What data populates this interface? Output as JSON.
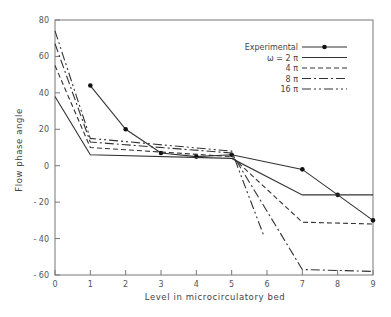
{
  "chart_data": {
    "type": "line",
    "title": "",
    "xlabel": "Level in microcirculatory bed",
    "ylabel": "Flow phase angle",
    "xlim": [
      0,
      9
    ],
    "ylim": [
      -60,
      80
    ],
    "x_ticks": [
      0,
      1,
      2,
      3,
      4,
      5,
      6,
      7,
      8,
      9
    ],
    "y_ticks": [
      -60,
      -40,
      -20,
      0,
      20,
      40,
      60,
      80
    ],
    "grid": false,
    "legend_position": "upper right",
    "series": [
      {
        "name": "Experimental",
        "style": "solid-with-markers",
        "points": [
          [
            1,
            44
          ],
          [
            2,
            20
          ],
          [
            3,
            7
          ],
          [
            4,
            5
          ],
          [
            5,
            6
          ],
          [
            7,
            -2
          ],
          [
            8,
            -16
          ],
          [
            9,
            -30
          ]
        ]
      },
      {
        "name": "ω = 2 π",
        "style": "solid",
        "points": [
          [
            0,
            38
          ],
          [
            1,
            6
          ],
          [
            5,
            4
          ],
          [
            7,
            -16
          ],
          [
            9,
            -16
          ]
        ]
      },
      {
        "name": "4 π",
        "style": "dashed",
        "points": [
          [
            0,
            55
          ],
          [
            1,
            10
          ],
          [
            5,
            5
          ],
          [
            7,
            -31
          ],
          [
            9,
            -32
          ]
        ]
      },
      {
        "name": "8 π",
        "style": "dash-dot",
        "points": [
          [
            0,
            67
          ],
          [
            1,
            13
          ],
          [
            5,
            7
          ],
          [
            7,
            -57
          ],
          [
            9,
            -58
          ]
        ]
      },
      {
        "name": "16 π",
        "style": "dash-dot-dot",
        "points": [
          [
            0,
            74
          ],
          [
            1,
            15
          ],
          [
            5,
            8
          ],
          [
            5.9,
            -38
          ]
        ]
      }
    ]
  },
  "legend": {
    "items": [
      {
        "label": "Experimental"
      },
      {
        "label": "ω = 2 π"
      },
      {
        "label": "4 π"
      },
      {
        "label": "8 π"
      },
      {
        "label": "16 π"
      }
    ]
  },
  "axes": {
    "x_title": "Level in microcirculatory bed",
    "y_title": "Flow phase angle",
    "x_tick_labels": [
      "0",
      "1",
      "2",
      "3",
      "4",
      "5",
      "6",
      "7",
      "8",
      "9"
    ],
    "y_tick_labels": [
      "80",
      "60",
      "40",
      "20",
      "0",
      "- 20",
      "- 40",
      "- 60"
    ]
  }
}
